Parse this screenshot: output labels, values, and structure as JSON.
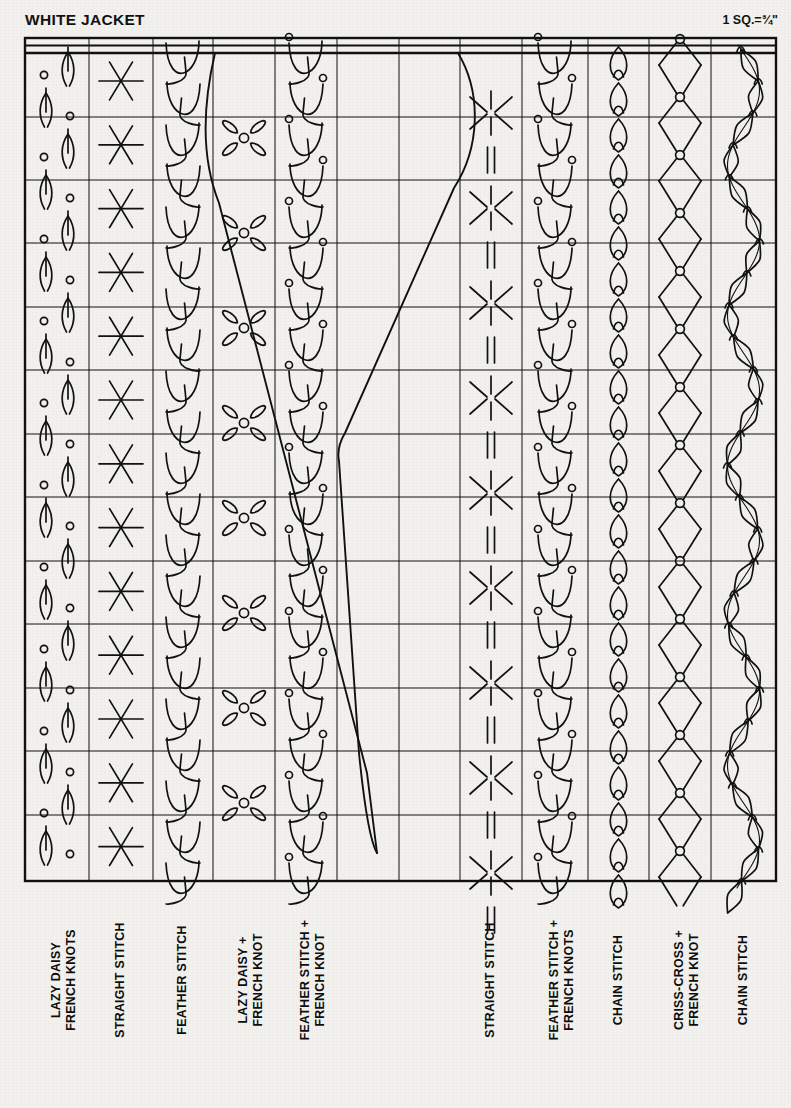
{
  "header": {
    "title": "WHITE JACKET",
    "scale_note": "1 SQ.=¾\""
  },
  "grid": {
    "left": 25,
    "top": 53,
    "right": 776,
    "bottom": 881,
    "columns": 12,
    "rows": 13,
    "col_x": [
      25,
      89,
      153,
      213,
      275,
      337,
      399,
      460,
      522,
      588,
      649,
      711,
      776
    ],
    "row_y": [
      53,
      117,
      180,
      243,
      307,
      370,
      434,
      497,
      561,
      624,
      688,
      751,
      815,
      881
    ],
    "line_color": "#111111",
    "outer_line_width": 2.4,
    "inner_line_width": 1.0,
    "background": "#f2f1ee"
  },
  "stitch_columns": [
    {
      "index": 1,
      "label": "LAZY DAISY\nFRENCH KNOTS",
      "motif": "lazy-daisy-french-knots"
    },
    {
      "index": 2,
      "label": "STRAIGHT STITCH",
      "motif": "six-point-star"
    },
    {
      "index": 3,
      "label": "FEATHER STITCH",
      "motif": "feather-stitch"
    },
    {
      "index": 4,
      "label": "LAZY DAISY +\nFRENCH KNOT",
      "motif": "four-petal-flower"
    },
    {
      "index": 5,
      "label": "FEATHER STITCH +\nFRENCH KNOT",
      "motif": "feather-stitch-knots"
    },
    {
      "index": 6,
      "label": "",
      "motif": "jacket-outline-left"
    },
    {
      "index": 7,
      "label": "",
      "motif": "jacket-outline-right"
    },
    {
      "index": 8,
      "label": "STRAIGHT STITCH",
      "motif": "cross-and-dash"
    },
    {
      "index": 9,
      "label": "FEATHER STITCH +\nFRENCH KNOTS",
      "motif": "feather-stitch-knots"
    },
    {
      "index": 10,
      "label": "CHAIN STITCH",
      "motif": "chain-loops"
    },
    {
      "index": 11,
      "label": "CRISS-CROSS +\nFRENCH KNOT",
      "motif": "criss-cross-knots"
    },
    {
      "index": 12,
      "label": "CHAIN STITCH",
      "motif": "wavy-chain"
    }
  ],
  "labels_bottom": [
    "LAZY DAISY\nFRENCH KNOTS",
    "STRAIGHT STITCH",
    "FEATHER STITCH",
    "LAZY DAISY +\nFRENCH KNOT",
    "FEATHER STITCH +\nFRENCH KNOT",
    "STRAIGHT STITCH",
    "FEATHER STITCH +\nFRENCH KNOTS",
    "CHAIN STITCH",
    "CRISS-CROSS +\nFRENCH KNOT",
    "CHAIN STITCH"
  ],
  "garment": {
    "name": "jacket-front-outline",
    "description": "V-neck jacket front panel outline drawn across middle columns"
  },
  "colors": {
    "ink": "#111111",
    "paper": "#f2f1ee"
  }
}
